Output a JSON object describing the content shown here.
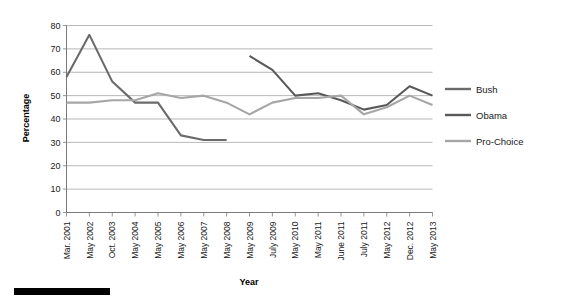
{
  "chart_data": {
    "type": "line",
    "title": "",
    "xlabel": "Year",
    "ylabel": "Percentage",
    "ylim": [
      0,
      80
    ],
    "yticks": [
      0,
      10,
      20,
      30,
      40,
      50,
      60,
      70,
      80
    ],
    "grid": true,
    "legend_position": "right",
    "categories": [
      "Mar. 2001",
      "May 2002",
      "Oct. 2003",
      "May 2004",
      "May 2005",
      "May 2006",
      "May 2007",
      "May 2008",
      "May 2009",
      "July 2009",
      "May 2010",
      "May 2011",
      "June 2011",
      "July 2011",
      "May 2012",
      "Dec. 2012",
      "May 2013"
    ],
    "series": [
      {
        "name": "Bush",
        "color": "#6b6b6b",
        "values": [
          58,
          76,
          56,
          47,
          47,
          33,
          31,
          31,
          null,
          null,
          null,
          null,
          null,
          null,
          null,
          null,
          null
        ]
      },
      {
        "name": "Obama",
        "color": "#595959",
        "values": [
          null,
          null,
          null,
          null,
          null,
          null,
          null,
          null,
          67,
          61,
          50,
          51,
          48,
          44,
          46,
          54,
          50
        ]
      },
      {
        "name": "Pro-Choice",
        "color": "#a6a6a6",
        "values": [
          47,
          47,
          48,
          48,
          51,
          49,
          50,
          47,
          42,
          47,
          49,
          49,
          50,
          42,
          45,
          50,
          46
        ]
      }
    ]
  },
  "legend": {
    "items": [
      {
        "label": "Bush",
        "color": "#6b6b6b"
      },
      {
        "label": "Obama",
        "color": "#595959"
      },
      {
        "label": "Pro-Choice",
        "color": "#a6a6a6"
      }
    ]
  },
  "axes": {
    "x_title": "Year",
    "y_title": "Percentage"
  }
}
